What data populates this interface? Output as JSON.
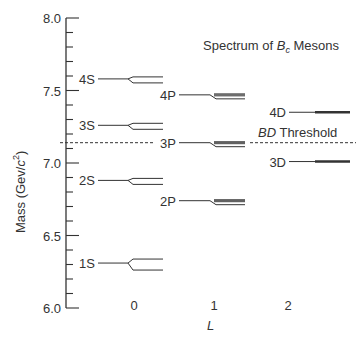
{
  "chart_data": {
    "type": "scatter",
    "title_parts": {
      "prefix": "Spectrum of ",
      "symbol": "B",
      "subscript": "c",
      "suffix": " Mesons"
    },
    "xlabel": "L",
    "ylabel": "Mass (Gev/c²)",
    "ylabel_parts": {
      "main": "Mass  (Gev/",
      "c": "c",
      "sup": "2",
      "close": ")"
    },
    "ylim": [
      6.0,
      8.0
    ],
    "y_ticks": [
      "6.0",
      "6.5",
      "7.0",
      "7.5",
      "8.0"
    ],
    "y_tick_values": [
      6.0,
      6.5,
      7.0,
      7.5,
      8.0
    ],
    "minor_tick_step": 0.1,
    "x_ticks": [
      "0",
      "1",
      "2"
    ],
    "grid": false,
    "levels": [
      {
        "label": "1S",
        "L": 0,
        "mass": 6.31
      },
      {
        "label": "2S",
        "L": 0,
        "mass": 6.88
      },
      {
        "label": "3S",
        "L": 0,
        "mass": 7.26
      },
      {
        "label": "4S",
        "L": 0,
        "mass": 7.58
      },
      {
        "label": "2P",
        "L": 1,
        "mass": 6.74
      },
      {
        "label": "3P",
        "L": 1,
        "mass": 7.14
      },
      {
        "label": "4P",
        "L": 1,
        "mass": 7.47
      },
      {
        "label": "3D",
        "L": 2,
        "mass": 7.01
      },
      {
        "label": "4D",
        "L": 2,
        "mass": 7.35
      }
    ],
    "threshold": {
      "label": "BD Threshold",
      "symbol": "BD",
      "text": " Threshold",
      "mass": 7.14
    }
  }
}
